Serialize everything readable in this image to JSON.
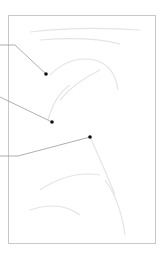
{
  "diagram": {
    "type": "annotated-image-figure",
    "colors": {
      "background": "#ffffff",
      "frame": "#c8c8c8",
      "leader_line": "#9a9a9a",
      "marker": "#111111",
      "faint_sketch": "#e6e6e6"
    },
    "frame": {
      "x": 8,
      "y": 15,
      "width": 148,
      "height": 229
    },
    "annotations": [
      {
        "id": "callout-1",
        "label": "",
        "points": [
          [
            0,
            45
          ],
          [
            15,
            45
          ],
          [
            46,
            74
          ]
        ],
        "marker": [
          46,
          74
        ]
      },
      {
        "id": "callout-2",
        "label": "",
        "points": [
          [
            0,
            97
          ],
          [
            52,
            122
          ]
        ],
        "marker": [
          52,
          122
        ]
      },
      {
        "id": "callout-3",
        "label": "",
        "points": [
          [
            0,
            156
          ],
          [
            18,
            156
          ],
          [
            90,
            137
          ]
        ],
        "marker": [
          90,
          137
        ]
      }
    ]
  }
}
